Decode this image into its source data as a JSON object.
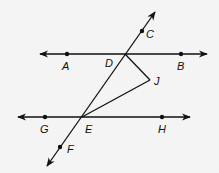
{
  "diagram": {
    "type": "geometry",
    "colors": {
      "background": "#f4f4f4",
      "stroke": "#111111"
    },
    "points": {
      "A": {
        "label": "A",
        "x": 67,
        "y": 54
      },
      "B": {
        "label": "B",
        "x": 181,
        "y": 54
      },
      "C": {
        "label": "C",
        "x": 142,
        "y": 31
      },
      "D": {
        "label": "D",
        "x": 125,
        "y": 54
      },
      "E": {
        "label": "E",
        "x": 82,
        "y": 117
      },
      "F": {
        "label": "F",
        "x": 60,
        "y": 147
      },
      "G": {
        "label": "G",
        "x": 45,
        "y": 117
      },
      "H": {
        "label": "H",
        "x": 162,
        "y": 117
      },
      "J": {
        "label": "J",
        "x": 150,
        "y": 80
      }
    },
    "lines": [
      {
        "name": "line-AB",
        "through": [
          "A",
          "D",
          "B"
        ],
        "arrows": "both"
      },
      {
        "name": "line-GH",
        "through": [
          "G",
          "E",
          "H"
        ],
        "arrows": "both"
      },
      {
        "name": "transversal-CF",
        "through": [
          "C",
          "D",
          "E",
          "F"
        ],
        "arrows": "both"
      }
    ],
    "segments": [
      {
        "name": "segment-DJ",
        "from": "D",
        "to": "J"
      },
      {
        "name": "segment-EJ",
        "from": "E",
        "to": "J"
      }
    ]
  }
}
